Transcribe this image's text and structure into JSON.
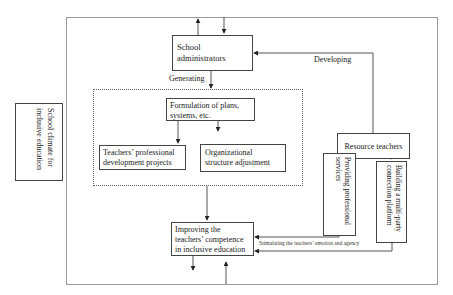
{
  "diagram": {
    "outer_context": {
      "label": "School climate for inclusive education"
    },
    "nodes": {
      "school_administrators": {
        "label": "School administrators"
      },
      "formulation": {
        "label": "Formulation of plans, systems, etc."
      },
      "teachers_pd": {
        "label": "Teachers’ professional development projects"
      },
      "org_structure": {
        "label": "Organizational structure adjustment"
      },
      "resource_teachers": {
        "label": "Resource teachers"
      },
      "providing_services": {
        "label": "Providing professional services"
      },
      "building_platform": {
        "label": "Building a multi-party connection platform"
      },
      "improving_competence": {
        "label": "Improving the teachers’ competence in inclusive education"
      }
    },
    "edge_labels": {
      "generating": "Generating",
      "developing": "Developing",
      "stimulating": "Stimulating the teachers’ emotion and agency"
    },
    "colors": {
      "line": "#444444",
      "frame": "#9a9a9a",
      "background": "#ffffff"
    }
  }
}
